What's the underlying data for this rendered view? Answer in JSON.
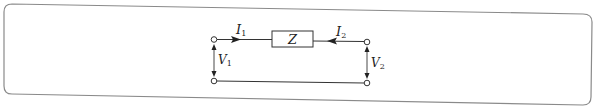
{
  "diagram": {
    "type": "two-port network",
    "element": {
      "label": "Z"
    },
    "currents": [
      {
        "symbol": "I",
        "subscript": "1",
        "direction": "into port 1 toward Z"
      },
      {
        "symbol": "I",
        "subscript": "2",
        "direction": "into port 2 toward Z"
      }
    ],
    "voltages": [
      {
        "symbol": "V",
        "subscript": "1",
        "port": "left"
      },
      {
        "symbol": "V",
        "subscript": "2",
        "port": "right"
      }
    ],
    "colors": {
      "line": "#333333",
      "frame": "#888888",
      "background": "#ffffff"
    }
  }
}
